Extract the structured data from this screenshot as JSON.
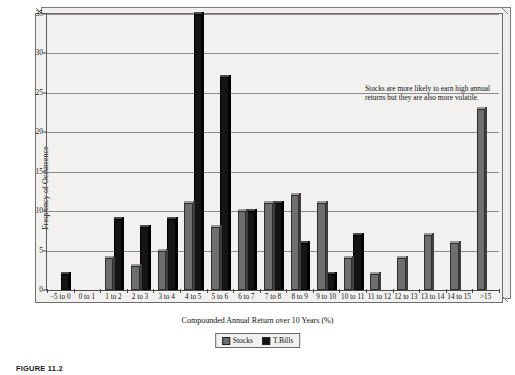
{
  "figure": {
    "caption": "FIGURE 11.2"
  },
  "annotation": {
    "text": "Stocks are more likely to earn high annual returns but they are also more volatile."
  },
  "legend": {
    "position": "bottom-center",
    "items": [
      {
        "label": "Stocks",
        "color": "#6e6e6e",
        "swatch": "stocks-swatch"
      },
      {
        "label": "T.Bills",
        "color": "#141414",
        "swatch": "tbills-swatch"
      }
    ]
  },
  "chart_data": {
    "type": "bar",
    "title": "",
    "subtitle": "",
    "xlabel": "Compounded Annual Return over 10 Years (%)",
    "ylabel": "Frequency of Occurrence",
    "ylim": [
      0,
      35
    ],
    "yticks": [
      0,
      5,
      10,
      15,
      20,
      25,
      30,
      35
    ],
    "ytick_labels": [
      "0",
      "5",
      "10",
      "15",
      "20",
      "25",
      "30",
      "35"
    ],
    "grid": true,
    "legend_position": "bottom-center",
    "categories": [
      "−5 to 0",
      "0 to 1",
      "1 to 2",
      "2 to 3",
      "3 to 4",
      "4 to 5",
      "5 to 6",
      "6 to 7",
      "7 to 8",
      "8 to 9",
      "9 to 10",
      "10 to 11",
      "11 to 12",
      "12 to 13",
      "13 to 14",
      "14 to 15",
      ">15"
    ],
    "series": [
      {
        "name": "Stocks",
        "color": "#6e6e6e",
        "values": [
          0,
          0,
          4,
          3,
          5,
          11,
          8,
          10,
          11,
          12,
          11,
          4,
          2,
          4,
          7,
          6,
          23
        ]
      },
      {
        "name": "T.Bills",
        "color": "#141414",
        "values": [
          2,
          0,
          9,
          8,
          9,
          35,
          27,
          10,
          11,
          6,
          2,
          7,
          0,
          0,
          0,
          0,
          0
        ]
      }
    ]
  }
}
